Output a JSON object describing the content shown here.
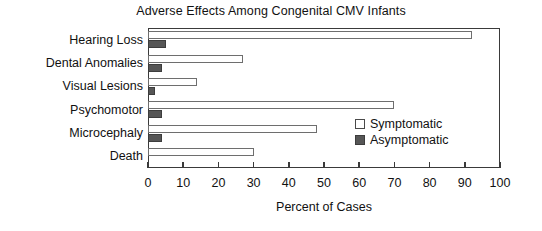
{
  "chart_data": {
    "type": "bar",
    "orientation": "horizontal",
    "title": "Adverse Effects Among Congenital CMV Infants",
    "xlabel": "Percent of Cases",
    "ylabel": "",
    "categories": [
      "Hearing Loss",
      "Dental Anomalies",
      "Visual Lesions",
      "Psychomotor",
      "Microcephaly",
      "Death"
    ],
    "series": [
      {
        "name": "Symptomatic",
        "color": "#ffffff",
        "edgecolor": "#6e6e6e",
        "values": [
          92,
          27,
          14,
          70,
          48,
          30
        ]
      },
      {
        "name": "Asymptomatic",
        "color": "#565656",
        "edgecolor": "#3d3d3d",
        "values": [
          5,
          4,
          2,
          4,
          4,
          0
        ]
      }
    ],
    "xlim": [
      0,
      100
    ],
    "xticks": [
      0,
      10,
      20,
      30,
      40,
      50,
      60,
      70,
      80,
      90,
      100
    ],
    "xtick_labels": [
      "0",
      "10",
      "20",
      "30",
      "40",
      "50",
      "60",
      "70",
      "80",
      "90",
      "100"
    ],
    "grid": false,
    "legend_position": "center-right",
    "legend_entries": [
      "Symptomatic",
      "Asymptomatic"
    ]
  }
}
